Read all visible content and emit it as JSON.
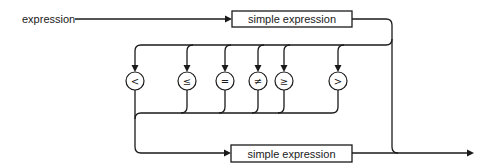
{
  "diagram": {
    "type": "syntax-diagram",
    "title": "expression",
    "nodes": {
      "top_box": "simple expression",
      "bottom_box": "simple expression"
    },
    "operators": [
      {
        "symbol": "<",
        "name": "less-than"
      },
      {
        "symbol": "≤",
        "name": "less-or-equal"
      },
      {
        "symbol": "=",
        "name": "equal"
      },
      {
        "symbol": "≠",
        "name": "not-equal"
      },
      {
        "symbol": "≥",
        "name": "greater-or-equal"
      },
      {
        "symbol": ">",
        "name": "greater-than"
      }
    ]
  }
}
